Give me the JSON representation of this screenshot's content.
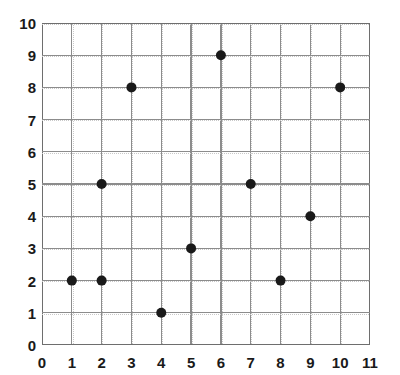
{
  "chart_data": {
    "type": "scatter",
    "title": "",
    "xlabel": "",
    "ylabel": "",
    "xlim": [
      0,
      11
    ],
    "ylim": [
      0,
      10
    ],
    "xticks": [
      "0",
      "1",
      "2",
      "3",
      "4",
      "5",
      "6",
      "7",
      "8",
      "9",
      "10",
      "11"
    ],
    "yticks": [
      "0",
      "1",
      "2",
      "3",
      "4",
      "5",
      "6",
      "7",
      "8",
      "9",
      "10"
    ],
    "grid": true,
    "legend": null,
    "marker": {
      "shape": "circle",
      "color": "#1a1a1a",
      "radius_px": 5
    },
    "colors": {
      "background": "#ffffff",
      "grid_line": "#8c8c8c",
      "axis_line": "#6e6e6e",
      "text": "#1a1a1a",
      "point": "#1a1a1a"
    },
    "points": [
      {
        "x": 1,
        "y": 2
      },
      {
        "x": 2,
        "y": 2
      },
      {
        "x": 2,
        "y": 5
      },
      {
        "x": 3,
        "y": 8
      },
      {
        "x": 4,
        "y": 1
      },
      {
        "x": 5,
        "y": 3
      },
      {
        "x": 6,
        "y": 9
      },
      {
        "x": 7,
        "y": 5
      },
      {
        "x": 8,
        "y": 2
      },
      {
        "x": 9,
        "y": 4
      },
      {
        "x": 10,
        "y": 8
      }
    ]
  }
}
